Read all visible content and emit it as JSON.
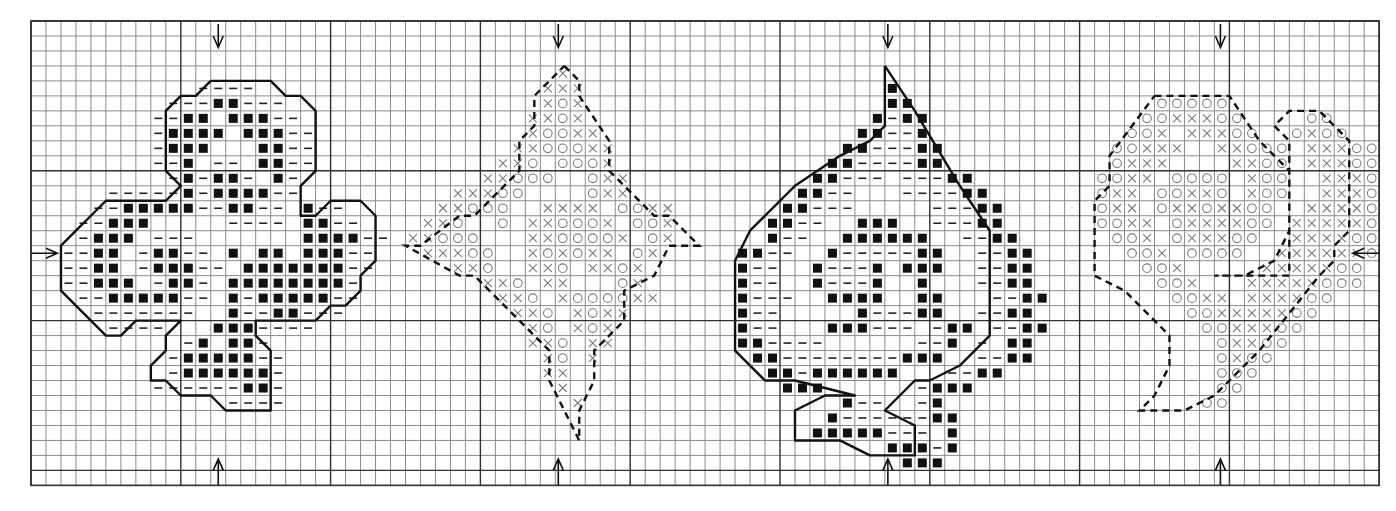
{
  "chart": {
    "grid": {
      "origin_x": 31,
      "origin_y": 21,
      "cell": 14.98,
      "cols": 90,
      "rows": 31,
      "major_every": 10
    },
    "colors": {
      "background": "#ffffff",
      "minor_grid": "#8a8a8a",
      "major_grid": "#303030",
      "solid_symbol": "#111111",
      "light_symbol": "#7a7a7a"
    },
    "legend": {
      "#": "filled-square-stitch",
      "-": "dash-stitch",
      "x": "cross-stitch",
      "o": "circle-stitch",
      ".": "empty"
    },
    "center_arrows": {
      "top": [
        12.5,
        35.2,
        57.2,
        79.4
      ],
      "bottom": [
        12.5,
        35.2,
        57.2,
        79.4
      ],
      "left_row": 15.5,
      "right_row": 15.5
    },
    "motifs": [
      {
        "name": "club",
        "outline": "solid",
        "col0": 2,
        "row0": 4,
        "rows": [
          ".........----.........",
          ".......---##---.......",
          "......--##.###--......",
          "......-####.###--.....",
          "......-###...##--.....",
          "......--#.--.##--.....",
          ".......-#-##-.#-......",
          "...-----#-####--......",
          "..--#####--##--.#--...",
          ".--###.....----.##--..",
          ".-###.---.......####--",
          "--##.-##--.#.##.###--.",
          "--##.-###--.#######--.",
          "--###.-##-.########-..",
          ".--#####--.#-#####--..",
          "..-------..#--##---...",
          "...----...###----.....",
          "........-#.##-........",
          ".......-#####--.......",
          ".......-######-.......",
          "......------##-.......",
          "...........----......."
        ],
        "outline_points": [
          [
            12,
            4
          ],
          [
            16,
            4
          ],
          [
            17,
            5
          ],
          [
            18,
            5
          ],
          [
            19,
            6
          ],
          [
            19,
            10
          ],
          [
            18,
            11
          ],
          [
            18,
            13
          ],
          [
            19,
            13
          ],
          [
            20,
            12
          ],
          [
            22,
            12
          ],
          [
            23,
            13
          ],
          [
            23,
            16
          ],
          [
            22,
            17
          ],
          [
            22,
            18
          ],
          [
            21,
            19
          ],
          [
            20,
            19
          ],
          [
            19,
            20
          ],
          [
            15,
            20
          ],
          [
            15,
            21
          ],
          [
            16,
            22
          ],
          [
            16,
            26
          ],
          [
            13,
            26
          ],
          [
            12,
            25
          ],
          [
            10,
            25
          ],
          [
            9,
            24
          ],
          [
            8,
            24
          ],
          [
            8,
            23
          ],
          [
            9,
            22
          ],
          [
            9,
            21
          ],
          [
            10,
            20
          ],
          [
            7,
            20
          ],
          [
            6,
            21
          ],
          [
            5,
            21
          ],
          [
            3,
            19
          ],
          [
            2,
            18
          ],
          [
            2,
            15
          ],
          [
            3,
            14
          ],
          [
            4,
            13
          ],
          [
            5,
            12
          ],
          [
            9,
            12
          ],
          [
            10,
            11
          ],
          [
            9,
            10
          ],
          [
            9,
            6
          ],
          [
            10,
            5
          ],
          [
            11,
            5
          ],
          [
            12,
            4
          ]
        ]
      },
      {
        "name": "diamond",
        "outline": "dashed",
        "col0": 25,
        "row0": 3,
        "rows": [
          "..........x.......",
          ".........xxx......",
          ".........xox......",
          "........xxox......",
          "........xooxx.....",
          ".......xxoooxx....",
          "......xxo.ooox....",
          ".....xxooo..oxx...",
          "...xxxoo....oxx...",
          "..xxooo..xxxx.ooxx",
          ".xxo..o.xxooox.oox",
          "xxooo...xxoooox.ox",
          ".xxxoo..xoxoxx.ox.",
          "...xxo..xxo.xxox..",
          ".....xxo.xx...ox..",
          "......xxo.xooooxx.",
          ".......xxo.xoxx...",
          "........xo.xox....",
          "........xxo.xx....",
          ".........xo.x.....",
          ".........xx.......",
          "..........x.......",
          "...........x......"
        ],
        "outline_points": [
          [
            35.6,
            3
          ],
          [
            36.6,
            4
          ],
          [
            36.6,
            5
          ],
          [
            38.6,
            8
          ],
          [
            38.6,
            10
          ],
          [
            41.6,
            13
          ],
          [
            42.6,
            13
          ],
          [
            44.6,
            15
          ],
          [
            42.6,
            15
          ],
          [
            41.6,
            17
          ],
          [
            39.6,
            18
          ],
          [
            39.6,
            20
          ],
          [
            37.6,
            22
          ],
          [
            37.6,
            24
          ],
          [
            36.6,
            26
          ],
          [
            36.6,
            28
          ],
          [
            35.6,
            26
          ],
          [
            34.6,
            24
          ],
          [
            34.6,
            22
          ],
          [
            33.6,
            21
          ],
          [
            29.6,
            17
          ],
          [
            28.6,
            17
          ],
          [
            25,
            15
          ],
          [
            26,
            15
          ],
          [
            28.6,
            13
          ],
          [
            29.6,
            13
          ],
          [
            32.6,
            10
          ],
          [
            32.6,
            8
          ],
          [
            33.6,
            7
          ],
          [
            33.6,
            5
          ],
          [
            34.6,
            4
          ],
          [
            35.6,
            3
          ]
        ]
      },
      {
        "name": "spade",
        "outline": "solid",
        "col0": 47,
        "row0": 4,
        "rows": [
          "..........#......",
          "..........##.....",
          ".........#-##....",
          "........##--#....",
          ".......##---##...",
          "......##----##...",
          ".....##---.---##.",
          "....##--...----##",
          "...##---.....---##",
          "..##--..###..---##",
          "..#--..######..--##",
          "##--..#-----##..--##",
          "#--..#---#.###..--##",
          "#--..#---#..#...--##",
          "#---..####..##...--##",
          "#--.....#---##..--##",
          "#--...###---.-##.--##",
          "##----......--#.-.##",
          ".##--------###..--##",
          "..##-######...--##",
          "...###......-###",
          ".......#--..-#.",
          "......#------##",
          ".....#####---.#",
          "..........###-#",
          "...........###"
        ],
        "outline_points": [
          [
            57,
            3
          ],
          [
            59,
            6
          ],
          [
            62,
            11
          ],
          [
            64,
            14
          ],
          [
            64,
            21
          ],
          [
            62,
            23
          ],
          [
            60,
            24
          ],
          [
            59,
            24
          ],
          [
            57,
            26
          ],
          [
            59,
            27
          ],
          [
            59,
            29
          ],
          [
            56,
            29
          ],
          [
            54,
            28
          ],
          [
            51,
            28
          ],
          [
            51,
            26
          ],
          [
            53,
            25
          ],
          [
            55,
            25
          ],
          [
            51,
            24
          ],
          [
            49,
            24
          ],
          [
            47,
            22
          ],
          [
            47,
            16
          ],
          [
            48,
            14
          ],
          [
            51,
            11
          ],
          [
            54,
            9
          ],
          [
            56,
            8
          ],
          [
            57,
            7
          ],
          [
            57,
            3
          ]
        ]
      },
      {
        "name": "heart",
        "outline": "dashed",
        "col0": 71,
        "row0": 5,
        "rows": [
          "....ooooo...........",
          "...ooxxxoo....oo....",
          "..oox.xxxoo..oxoo...",
          ".ooxxx..xxooo.xxxoo.",
          ".oxxx....xxoo.xxxoo.",
          "ooxx.oooo.xoo..xxxo.",
          "oxx.ooxxo.xoo..xxxo.",
          "oxx.oxxoxxoo..xxxxo.",
          "ooxx.oxxxxoo.xxxxxo.",
          ".oox.oxxxoo..xxxxoo.",
          "..oox.oooo..xxxxxxo.",
          "...oox.....xxxxxoo..",
          "....oox...xxxxxooo..",
          ".....ooxx.xxxxoo....",
          "......ooxxxxxoo.....",
          ".......ooxxxoo......",
          "........oxxoo.......",
          "........oxoo........",
          "........ooo.........",
          "........oo..........",
          ".......oo..........."
        ],
        "outline_points": [
          [
            75,
            5
          ],
          [
            80,
            5
          ],
          [
            82,
            8
          ],
          [
            84,
            10
          ],
          [
            84,
            14
          ],
          [
            83,
            16
          ],
          [
            81,
            17
          ],
          [
            79,
            17
          ],
          [
            84,
            17
          ],
          [
            84,
            8
          ],
          [
            83,
            7
          ],
          [
            84,
            6
          ],
          [
            86,
            6
          ],
          [
            88,
            8
          ],
          [
            88,
            14
          ],
          [
            87,
            15
          ],
          [
            87,
            16
          ],
          [
            86,
            17
          ],
          [
            82,
            22
          ],
          [
            79,
            25
          ],
          [
            77,
            26
          ],
          [
            74,
            26
          ],
          [
            75,
            25
          ],
          [
            76,
            23
          ],
          [
            76,
            21
          ],
          [
            75,
            20
          ],
          [
            73,
            18
          ],
          [
            71,
            17
          ],
          [
            71,
            12
          ],
          [
            72,
            11
          ],
          [
            72,
            9
          ],
          [
            75,
            5
          ]
        ]
      }
    ]
  }
}
